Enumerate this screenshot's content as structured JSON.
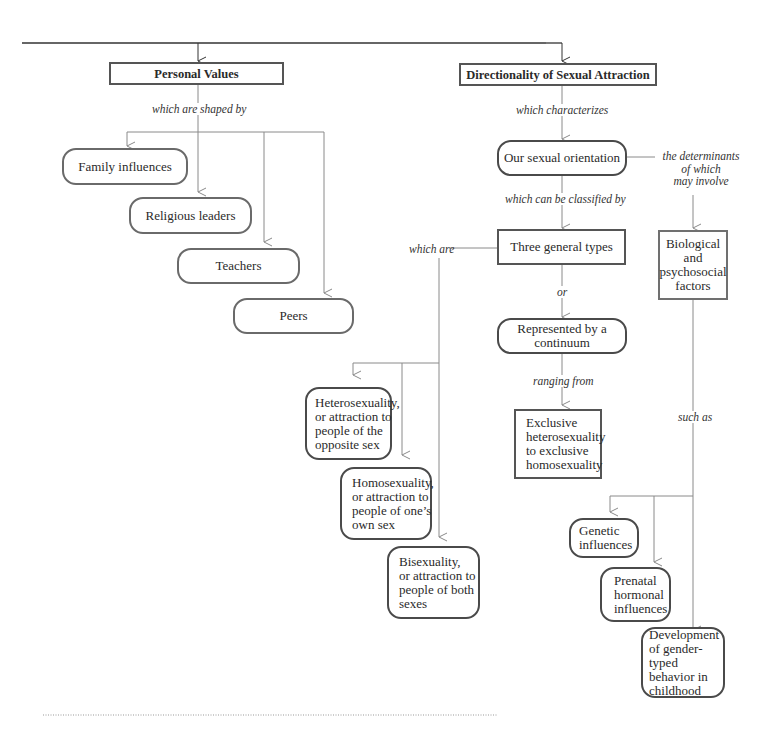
{
  "diagram": {
    "type": "concept-map",
    "left_branch": {
      "title": "Personal Values",
      "link_label": "which are shaped by",
      "children": [
        "Family influences",
        "Religious leaders",
        "Teachers",
        "Peers"
      ]
    },
    "right_branch": {
      "title": "Directionality of Sexual Attraction",
      "link_characterizes": "which characterizes",
      "orientation": "Our sexual orientation",
      "link_classified": "which can be classified by",
      "link_determinants": "the determinants\nof which\nmay involve",
      "three_types": "Three general types",
      "link_which_are": "which are",
      "link_or": "or",
      "continuum": "Represented by a\ncontinuum",
      "link_ranging": "ranging from",
      "continuum_range": "Exclusive\nheterosexuality\nto exclusive\nhomosexuality",
      "types": [
        "Heterosexuality,\nor attraction to\npeople of the\nopposite sex",
        "Homosexuality,\nor attraction to\npeople of one’s\nown sex",
        "Bisexuality,\nor attraction to\npeople of both\nsexes"
      ],
      "factors": "Biological\nand\npsychosocial\nfactors",
      "link_such_as": "such as",
      "factor_examples": [
        "Genetic\ninfluences",
        "Prenatal\nhormonal\ninfluences",
        "Development\nof gender-typed\nbehavior in\nchildhood"
      ]
    }
  },
  "colors": {
    "line": "#8a8a8a",
    "main_line": "#333333",
    "border": "#555555",
    "background": "#ffffff"
  }
}
